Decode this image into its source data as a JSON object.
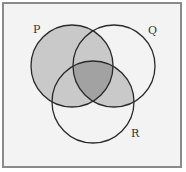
{
  "diagram": {
    "type": "venn",
    "sets": [
      {
        "id": "P",
        "label": "P",
        "cx": 72,
        "cy": 66,
        "r": 41
      },
      {
        "id": "Q",
        "label": "Q",
        "cx": 114,
        "cy": 66,
        "r": 41
      },
      {
        "id": "R",
        "label": "R",
        "cx": 93,
        "cy": 102,
        "r": 41
      }
    ],
    "shaded_regions": [
      "P only",
      "P∩Q only",
      "P∩R only",
      "Q∩R only",
      "P∩Q∩R"
    ],
    "unshaded_regions": [
      "Q only",
      "R only"
    ],
    "colors": {
      "background": "#f3f3f3",
      "border": "#8a8a8a",
      "light_shade": "#c9c9c9",
      "dark_shade": "#a2a2a2",
      "stroke": "#2a2a2a"
    }
  },
  "labels": {
    "P": "P",
    "Q": "Q",
    "R": "R"
  }
}
